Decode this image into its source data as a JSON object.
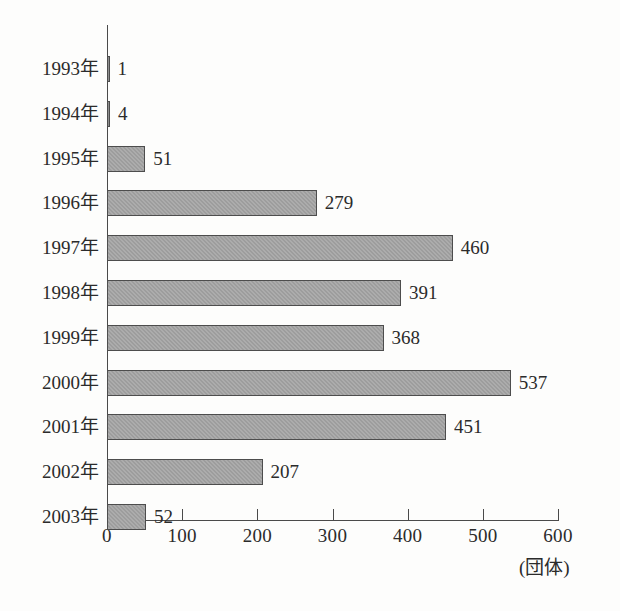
{
  "chart_data": {
    "type": "bar",
    "orientation": "horizontal",
    "title": "",
    "subtitle": "",
    "xlabel": "(団体)",
    "ylabel": "",
    "xlim": [
      0,
      600
    ],
    "ylim": null,
    "grid": false,
    "legend": null,
    "legend_position": "none",
    "x_ticks": [
      "0",
      "100",
      "200",
      "300",
      "400",
      "500",
      "600"
    ],
    "x_tick_values": [
      0,
      100,
      200,
      300,
      400,
      500,
      600
    ],
    "categories": [
      "1993年",
      "1994年",
      "1995年",
      "1996年",
      "1997年",
      "1998年",
      "1999年",
      "2000年",
      "2001年",
      "2002年",
      "2003年"
    ],
    "values": [
      1,
      4,
      51,
      279,
      460,
      391,
      368,
      537,
      451,
      207,
      52
    ],
    "value_labels": [
      "1",
      "4",
      "51",
      "279",
      "460",
      "391",
      "368",
      "537",
      "451",
      "207",
      "52"
    ],
    "unit": "団体",
    "bar_color": "#9d9d9d",
    "bar_border_color": "#4d4d4d",
    "axis_color": "#4a4a4a",
    "text_color": "#2b2b2b",
    "background_color": "#fdfdfc"
  }
}
